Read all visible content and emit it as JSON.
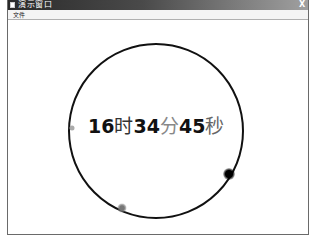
{
  "window": {
    "title": "演示窗口",
    "close_label": "X"
  },
  "menu": {
    "items": [
      {
        "label": "文件"
      }
    ]
  },
  "clock": {
    "hours": "16",
    "hour_unit": "时",
    "minutes": "34",
    "minute_unit": "分",
    "seconds": "45",
    "second_unit": "秒",
    "dial": {
      "cx": 148,
      "cy": 111,
      "r": 87,
      "stroke": "#111111"
    },
    "markers": {
      "hour": {
        "cx": 221,
        "cy": 154,
        "r": 5,
        "color": "#000000"
      },
      "minute": {
        "cx": 114,
        "cy": 188,
        "r": 4,
        "color": "#777777"
      },
      "second": {
        "cx": 64,
        "cy": 108,
        "r": 2.5,
        "color": "#aaaaaa"
      }
    }
  }
}
